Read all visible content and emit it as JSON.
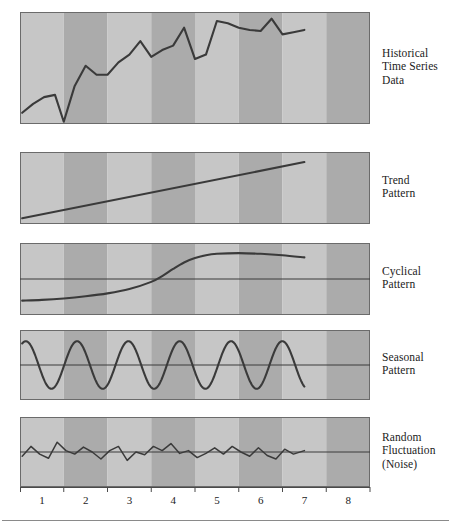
{
  "figure": {
    "title": "",
    "panel_left": 20,
    "panel_right": 370,
    "stripe_count": 8,
    "colors": {
      "stripe_light": "#c6c6c6",
      "stripe_dark": "#ababab",
      "panel_border": "#6b6b6b",
      "data_line": "#3a3a3a",
      "reference_line": "#3a3a3a",
      "axis_line": "#4a4a4a",
      "text": "#1b1b1b",
      "rule": "#8a8a8a"
    }
  },
  "axis": {
    "tick_labels": [
      "1",
      "2",
      "3",
      "4",
      "5",
      "6",
      "7",
      "8"
    ],
    "x_min": 0,
    "x_max": 8,
    "data_end": 6.5
  },
  "panels": [
    {
      "id": "historical",
      "label": "Historical\nTime Series\nData",
      "label_lines": [
        "Historical",
        "Time Series",
        "Data"
      ],
      "has_reference_line": false,
      "top": 12,
      "height": 112
    },
    {
      "id": "trend",
      "label": "Trend\nPattern",
      "label_lines": [
        "Trend",
        "Pattern"
      ],
      "has_reference_line": false,
      "top": 152,
      "height": 72
    },
    {
      "id": "cyclical",
      "label": "Cyclical\nPattern",
      "label_lines": [
        "Cyclical",
        "Pattern"
      ],
      "has_reference_line": true,
      "top": 243,
      "height": 72
    },
    {
      "id": "seasonal",
      "label": "Seasonal\nPattern",
      "label_lines": [
        "Seasonal",
        "Pattern"
      ],
      "has_reference_line": true,
      "top": 330,
      "height": 70
    },
    {
      "id": "noise",
      "label": "Random\nFluctuation\n(Noise)",
      "label_lines": [
        "Random",
        "Fluctuation",
        "(Noise)"
      ],
      "has_reference_line": true,
      "top": 417,
      "height": 70
    }
  ],
  "chart_data": {
    "type": "line",
    "xlabel": "",
    "ylabel": "",
    "xlim": [
      0,
      8
    ],
    "grid": false,
    "legend": "right-side panel labels",
    "charts": [
      {
        "name": "Historical Time Series Data",
        "type": "line",
        "ylim": [
          0,
          1
        ],
        "x": [
          0.05,
          0.3,
          0.55,
          0.8,
          1.0,
          1.25,
          1.5,
          1.75,
          2.0,
          2.25,
          2.5,
          2.75,
          3.0,
          3.25,
          3.5,
          3.75,
          4.0,
          4.25,
          4.5,
          4.75,
          5.0,
          5.25,
          5.5,
          5.75,
          6.0,
          6.25,
          6.5
        ],
        "y": [
          0.1,
          0.18,
          0.24,
          0.26,
          0.02,
          0.34,
          0.52,
          0.44,
          0.44,
          0.55,
          0.62,
          0.74,
          0.6,
          0.66,
          0.7,
          0.86,
          0.58,
          0.62,
          0.92,
          0.9,
          0.86,
          0.84,
          0.83,
          0.94,
          0.8,
          0.82,
          0.84
        ]
      },
      {
        "name": "Trend Pattern",
        "type": "line",
        "ylim": [
          0,
          1
        ],
        "x": [
          0.05,
          6.5
        ],
        "y": [
          0.08,
          0.86
        ]
      },
      {
        "name": "Cyclical Pattern",
        "type": "line",
        "ylim": [
          0,
          1
        ],
        "reference_level": 0.5,
        "x": [
          0.05,
          0.5,
          1.0,
          1.5,
          2.0,
          2.5,
          3.0,
          3.25,
          3.5,
          3.75,
          4.0,
          4.25,
          4.5,
          5.0,
          5.5,
          6.0,
          6.5
        ],
        "y": [
          0.2,
          0.21,
          0.23,
          0.26,
          0.3,
          0.36,
          0.46,
          0.54,
          0.64,
          0.73,
          0.79,
          0.83,
          0.85,
          0.86,
          0.85,
          0.83,
          0.8
        ]
      },
      {
        "name": "Seasonal Pattern",
        "type": "line",
        "ylim": [
          0,
          1
        ],
        "reference_level": 0.5,
        "wave": {
          "cycles": 5.5,
          "amplitude": 0.34,
          "phase_start": 0.18
        },
        "x_start": 0.05,
        "x_end": 6.5
      },
      {
        "name": "Random Fluctuation (Noise)",
        "type": "line",
        "ylim": [
          0,
          1
        ],
        "reference_level": 0.5,
        "x": [
          0.05,
          0.25,
          0.45,
          0.65,
          0.85,
          1.05,
          1.25,
          1.45,
          1.65,
          1.85,
          2.05,
          2.25,
          2.45,
          2.65,
          2.85,
          3.05,
          3.25,
          3.45,
          3.65,
          3.85,
          4.05,
          4.25,
          4.45,
          4.65,
          4.85,
          5.05,
          5.25,
          5.45,
          5.65,
          5.85,
          6.05,
          6.25,
          6.5
        ],
        "y": [
          0.44,
          0.58,
          0.47,
          0.41,
          0.64,
          0.52,
          0.47,
          0.57,
          0.5,
          0.4,
          0.52,
          0.58,
          0.38,
          0.5,
          0.46,
          0.58,
          0.52,
          0.62,
          0.48,
          0.52,
          0.42,
          0.48,
          0.56,
          0.47,
          0.58,
          0.5,
          0.44,
          0.56,
          0.45,
          0.4,
          0.54,
          0.47,
          0.52
        ]
      }
    ]
  }
}
